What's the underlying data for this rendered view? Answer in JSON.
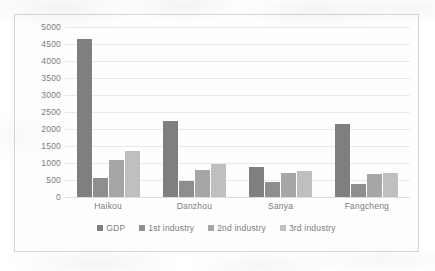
{
  "chart_data": {
    "type": "bar",
    "title": "",
    "xlabel": "",
    "ylabel": "",
    "ylim": [
      0,
      5000
    ],
    "ytick_step": 500,
    "yticks": [
      "5000",
      "4500",
      "4000",
      "3500",
      "3000",
      "2500",
      "2000",
      "1500",
      "1000",
      "500",
      "0"
    ],
    "grid": true,
    "legend_position": "bottom",
    "categories": [
      "Haikou",
      "Danzhou",
      "Sanya",
      "Fangcheng"
    ],
    "series": [
      {
        "name": "GDP",
        "color": "#7f7f7f",
        "values": [
          4650,
          2230,
          870,
          2160
        ]
      },
      {
        "name": "1st industry",
        "color": "#8e8e8e",
        "values": [
          550,
          470,
          450,
          390
        ]
      },
      {
        "name": "2nd industry",
        "color": "#a6a6a6",
        "values": [
          1100,
          780,
          720,
          670
        ]
      },
      {
        "name": "3rd industry",
        "color": "#bfbfbf",
        "values": [
          1360,
          970,
          770,
          700
        ]
      }
    ]
  },
  "style": {
    "border_color": "#d6d6d6",
    "gridline_color": "#e9e9e9",
    "text_color": "#7b7b7b",
    "background": "#ffffff"
  }
}
